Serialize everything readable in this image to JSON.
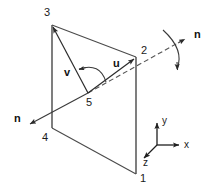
{
  "figure": {
    "background_color": "#ffffff",
    "line_color": "#3a3a3a",
    "text_color": "#1a1a1a"
  },
  "nodes": [
    {
      "id": "1",
      "label": "1",
      "x": 136,
      "y": 174,
      "label_x": 140,
      "label_y": 182
    },
    {
      "id": "2",
      "label": "2",
      "x": 136,
      "y": 57,
      "label_x": 141,
      "label_y": 54
    },
    {
      "id": "3",
      "label": "3",
      "x": 52,
      "y": 25,
      "label_x": 44,
      "label_y": 16
    },
    {
      "id": "4",
      "label": "4",
      "x": 52,
      "y": 128,
      "label_x": 42,
      "label_y": 141
    },
    {
      "id": "5",
      "label": "5",
      "x": 88,
      "y": 93,
      "label_x": 86,
      "label_y": 106
    }
  ],
  "vectors": [
    {
      "name": "u",
      "label": "u",
      "label_x": 113,
      "label_y": 67,
      "from": "5",
      "to": "2"
    },
    {
      "name": "v",
      "label": "v",
      "label_x": 64,
      "label_y": 76,
      "from": "5",
      "to": "3"
    }
  ],
  "normals": [
    {
      "name": "normal-right",
      "label": "n",
      "label_x": 194,
      "label_y": 38,
      "direction": "up-right"
    },
    {
      "name": "normal-left",
      "label": "n",
      "label_x": 14,
      "label_y": 122,
      "direction": "down-left"
    }
  ],
  "rotation_arc": {
    "name": "rotation-indicator",
    "description": "curved arrow showing rotation about the normal axis"
  },
  "triad": {
    "origin_x": 157,
    "origin_y": 145,
    "axes": [
      {
        "name": "y",
        "label": "y",
        "label_x": 162,
        "label_y": 124
      },
      {
        "name": "x",
        "label": "x",
        "label_x": 184,
        "label_y": 148
      },
      {
        "name": "z",
        "label": "z",
        "label_x": 143,
        "label_y": 166
      }
    ]
  }
}
